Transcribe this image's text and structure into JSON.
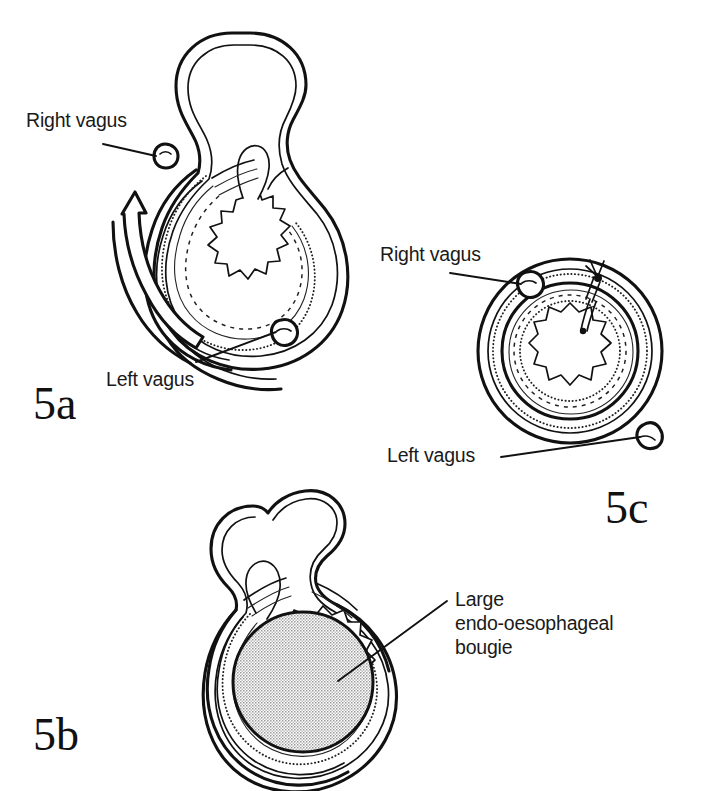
{
  "figure": {
    "background_color": "#ffffff",
    "ink_color": "#111111",
    "bougie_fill_color": "#c9c9c9"
  },
  "panels": [
    {
      "id": "5a",
      "label": "5a",
      "description": "Oesophagus with gastric fundus being wrapped around it, rotation arrow",
      "annotations": [
        {
          "name": "right-vagus",
          "text": "Right vagus"
        },
        {
          "name": "left-vagus",
          "text": "Left vagus"
        }
      ],
      "has_rotation_arrow": true,
      "has_bougie": false,
      "has_suture": false
    },
    {
      "id": "5b",
      "label": "5b",
      "description": "Wrap completed around a large endo-oesophageal bougie inside the lumen",
      "annotations": [
        {
          "name": "bougie",
          "text": "Large\nendo-oesophageal\nbougie"
        }
      ],
      "has_rotation_arrow": false,
      "has_bougie": true,
      "has_suture": false
    },
    {
      "id": "5c",
      "label": "5c",
      "description": "Completed circular wrap sutured anteriorly, both vagus nerves outside",
      "annotations": [
        {
          "name": "right-vagus",
          "text": "Right vagus"
        },
        {
          "name": "left-vagus",
          "text": "Left vagus"
        }
      ],
      "has_rotation_arrow": false,
      "has_bougie": false,
      "has_suture": true
    }
  ],
  "labels": {
    "panel_a": "5a",
    "panel_b": "5b",
    "panel_c": "5c",
    "right_vagus": "Right vagus",
    "left_vagus": "Left vagus",
    "bougie_line1": "Large",
    "bougie_line2": "endo-oesophageal",
    "bougie_line3": "bougie"
  }
}
